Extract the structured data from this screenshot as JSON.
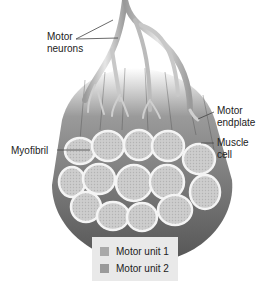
{
  "diagram": {
    "labels": {
      "motor_neurons": [
        "Motor",
        "neurons"
      ],
      "motor_endplate": [
        "Motor",
        "endplate"
      ],
      "muscle_cell": [
        "Muscle",
        "cell"
      ],
      "myofibril": "Myofibril"
    },
    "legend": [
      {
        "label": "Motor unit 1",
        "color": "#a9a9a9"
      },
      {
        "label": "Motor unit 2",
        "color": "#9a9a9a"
      }
    ],
    "colors": {
      "fiber_dark": "#5f5f5f",
      "fiber_mid": "#8a8a8a",
      "cross_section_fill": "#cfcfcf",
      "cross_section_border": "#f4f4f4",
      "neuron": "#bdbdbd",
      "leader_line": "#444444"
    }
  }
}
